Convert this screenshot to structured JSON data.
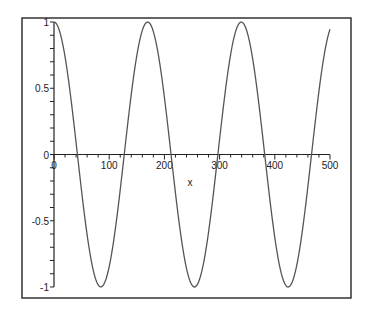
{
  "chart_data": {
    "type": "line",
    "title": "",
    "xlabel": "x",
    "ylabel": "",
    "xlim": [
      0,
      500
    ],
    "ylim": [
      -1,
      1
    ],
    "x_ticks": [
      "0",
      "100",
      "200",
      "300",
      "400",
      "500"
    ],
    "y_ticks": [
      "-1",
      "-0.5",
      "0",
      "0.5",
      "1"
    ],
    "grid": false,
    "legend": null,
    "series": [
      {
        "name": "cos(x/27)",
        "formula": "cos(x/27)",
        "x": [
          0,
          42,
          85,
          127,
          170,
          212,
          254,
          297,
          339,
          382,
          424,
          466,
          500
        ],
        "values": [
          1,
          0,
          -1,
          0,
          1,
          0,
          -1,
          0,
          1,
          0,
          -1,
          0,
          0.9
        ]
      }
    ],
    "colors": {
      "line": "#555555",
      "axes": "#222222",
      "frame": "#333333"
    }
  }
}
